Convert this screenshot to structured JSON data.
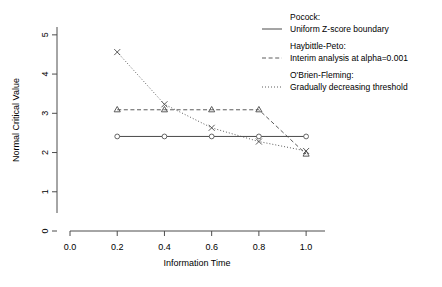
{
  "chart_data": {
    "type": "line",
    "title": "",
    "xlabel": "Information Time",
    "ylabel": "Normal Critical Value",
    "xlim": [
      0.0,
      1.08
    ],
    "ylim": [
      0,
      5.2
    ],
    "xticks": [
      "0.0",
      "0.2",
      "0.4",
      "0.6",
      "0.8",
      "1.0"
    ],
    "xtick_values": [
      0.0,
      0.2,
      0.4,
      0.6,
      0.8,
      1.0
    ],
    "yticks": [
      "0",
      "1",
      "2",
      "3",
      "4",
      "5"
    ],
    "ytick_values": [
      0,
      1,
      2,
      3,
      4,
      5
    ],
    "grid": false,
    "legend_position": "right",
    "x": [
      0.2,
      0.4,
      0.6,
      0.8,
      1.0
    ],
    "series": [
      {
        "name": "Pocock",
        "marker": "circle",
        "linestyle": "solid",
        "values": [
          2.41,
          2.41,
          2.41,
          2.41,
          2.41
        ]
      },
      {
        "name": "Haybittle-Peto",
        "marker": "triangle",
        "linestyle": "dashed",
        "values": [
          3.09,
          3.09,
          3.09,
          3.09,
          1.96
        ]
      },
      {
        "name": "O'Brien-Fleming",
        "marker": "x",
        "linestyle": "dotted",
        "values": [
          4.56,
          3.23,
          2.63,
          2.28,
          2.04
        ]
      }
    ]
  },
  "legend": {
    "entries": [
      {
        "title": "Pocock:",
        "description": "Uniform Z-score boundary",
        "linestyle": "solid"
      },
      {
        "title": "Haybittle-Peto:",
        "description": "Interim analysis at alpha=0.001",
        "linestyle": "dashed"
      },
      {
        "title": "O'Brien-Fleming:",
        "description": "Gradually decreasing threshold",
        "linestyle": "dotted"
      }
    ]
  },
  "colors": {
    "line": "#4a4a4a",
    "axis": "#4d4d4d",
    "text": "#000000",
    "background": "#ffffff"
  }
}
